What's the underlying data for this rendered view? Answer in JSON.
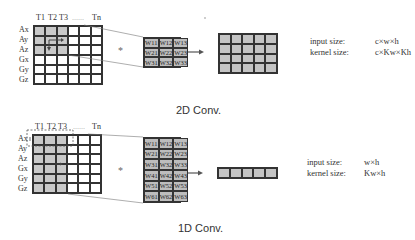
{
  "diagram_2d": {
    "caption": "2D Conv.",
    "column_labels": [
      "T1",
      "T2",
      "T3",
      "......",
      "Tn"
    ],
    "row_labels": [
      "Ax",
      "Ay",
      "Az",
      "Gx",
      "Gy",
      "Gz"
    ],
    "input_grid": {
      "rows": 6,
      "cols": 6,
      "shaded": "top-left 3x3"
    },
    "operator": "*",
    "kernel": {
      "rows": 3,
      "cols": 3,
      "cells": [
        "W11",
        "W12",
        "W13",
        "W21",
        "W22",
        "W23",
        "W31",
        "W32",
        "W33"
      ]
    },
    "output_grid": {
      "rows": 4,
      "cols": 5
    },
    "info": {
      "input_label": "input size:",
      "input_value": "c×w×h",
      "kernel_label": "kernel size:",
      "kernel_value": "c×Kw×Kh"
    }
  },
  "diagram_1d": {
    "caption": "1D Conv.",
    "column_labels": [
      "T1",
      "T2",
      "T3",
      "......",
      "Tn"
    ],
    "row_labels": [
      "Ax",
      "Ay",
      "Az",
      "Gx",
      "Gy",
      "Gz"
    ],
    "input_grid": {
      "rows": 6,
      "cols": 6,
      "shaded": "first 3 columns"
    },
    "operator": "*",
    "kernel": {
      "rows": 6,
      "cols": 3,
      "cells": [
        "W11",
        "W12",
        "W13",
        "W21",
        "W22",
        "W23",
        "W31",
        "W32",
        "W33",
        "W41",
        "W42",
        "W43",
        "W51",
        "W52",
        "W53",
        "W61",
        "W62",
        "W63"
      ]
    },
    "output_grid": {
      "rows": 1,
      "cols": 5
    },
    "info": {
      "input_label": "input size:",
      "input_value": "w×h",
      "kernel_label": "kernel size:",
      "kernel_value": "Kw×h"
    }
  }
}
